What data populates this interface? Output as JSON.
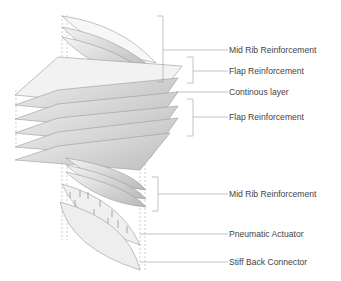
{
  "diagram": {
    "colors": {
      "background": "#ffffff",
      "line": "#9a9a9a",
      "text": "#444444",
      "layer_light": "#f2f2f2",
      "layer_dark": "#bdbdbd"
    },
    "labels": [
      {
        "id": "mid-rib-top",
        "text": "Mid Rib Reinforcement"
      },
      {
        "id": "flap-top",
        "text": "Flap Reinforcement"
      },
      {
        "id": "continuous",
        "text": "Continous layer"
      },
      {
        "id": "flap-bottom",
        "text": "Flap Reinforcement"
      },
      {
        "id": "mid-rib-bottom",
        "text": "Mid Rib Reinforcement"
      },
      {
        "id": "pneumatic",
        "text": "Pneumatic Actuator"
      },
      {
        "id": "stiff-back",
        "text": "Stiff Back Connector"
      }
    ]
  }
}
